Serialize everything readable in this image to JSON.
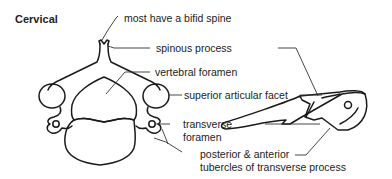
{
  "diagram": {
    "title": "Cervical",
    "labels": {
      "bifid_spine": "most have a bifid spine",
      "spinous_process": "spinous process",
      "vertebral_foramen": "vertebral foramen",
      "superior_articular_facet": "superior articular facet",
      "transverse_foramen_line1": "transverse",
      "transverse_foramen_line2": "foramen",
      "tubercles_line1": "posterior & anterior",
      "tubercles_line2": "tubercles of transverse process"
    },
    "views": [
      "superior view",
      "lateral view"
    ],
    "colors": {
      "stroke": "#1a1a1a",
      "leader": "#333333",
      "text": "#222222",
      "background": "#ffffff"
    }
  }
}
